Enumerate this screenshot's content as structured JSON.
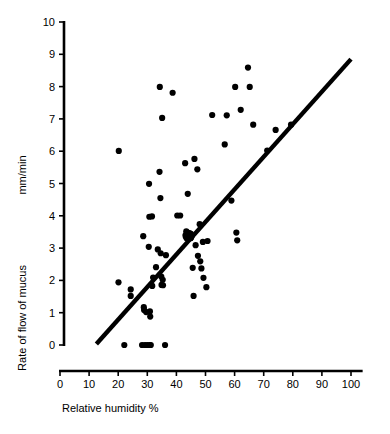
{
  "chart_data": {
    "type": "scatter",
    "title": "",
    "xlabel": "Relative humidity %",
    "ylabel_primary": "mm/min",
    "ylabel_secondary": "Rate of flow of mucus",
    "xlim": [
      0,
      104
    ],
    "ylim": [
      0,
      10
    ],
    "grid": false,
    "legend": null,
    "x_ticks": [
      0,
      10,
      20,
      30,
      40,
      50,
      60,
      70,
      80,
      90,
      100
    ],
    "x_tick_labels": [
      "0",
      "10",
      "20",
      "30",
      "40",
      "50",
      "60",
      "70",
      "80",
      "90",
      "100"
    ],
    "y_ticks": [
      0,
      1,
      2,
      3,
      4,
      5,
      6,
      7,
      8,
      9,
      10
    ],
    "y_tick_labels": [
      "0",
      "1",
      "2",
      "3",
      "4",
      "5",
      "6",
      "7",
      "8",
      "9",
      "10"
    ],
    "marker_color": "#000000",
    "marker_size": 3.1,
    "centroid": {
      "x": 44.2,
      "y": 3.38,
      "size": 6.2
    },
    "fit_line": {
      "color": "#000000",
      "width": 4.4,
      "x_start": 12.5,
      "y_start": 0.03,
      "x_end": 100.0,
      "y_end": 8.85
    },
    "points": [
      {
        "x": 20.2,
        "y": 6.01
      },
      {
        "x": 20.1,
        "y": 1.94
      },
      {
        "x": 22.1,
        "y": 0.0
      },
      {
        "x": 24.3,
        "y": 1.72
      },
      {
        "x": 24.3,
        "y": 1.52
      },
      {
        "x": 28.2,
        "y": 0.0
      },
      {
        "x": 28.6,
        "y": 3.37
      },
      {
        "x": 28.8,
        "y": 1.17
      },
      {
        "x": 28.9,
        "y": 1.08
      },
      {
        "x": 29.2,
        "y": 0.0
      },
      {
        "x": 29.6,
        "y": 1.02
      },
      {
        "x": 30.0,
        "y": 0.0
      },
      {
        "x": 30.5,
        "y": 3.04
      },
      {
        "x": 30.6,
        "y": 4.99
      },
      {
        "x": 30.7,
        "y": 3.97
      },
      {
        "x": 30.8,
        "y": 0.0
      },
      {
        "x": 30.9,
        "y": 1.04
      },
      {
        "x": 31.0,
        "y": 0.88
      },
      {
        "x": 31.2,
        "y": 0.0
      },
      {
        "x": 31.6,
        "y": 3.98
      },
      {
        "x": 31.7,
        "y": 1.83
      },
      {
        "x": 32.0,
        "y": 2.09
      },
      {
        "x": 33.0,
        "y": 2.41
      },
      {
        "x": 33.6,
        "y": 2.96
      },
      {
        "x": 34.2,
        "y": 5.36
      },
      {
        "x": 34.3,
        "y": 7.99
      },
      {
        "x": 34.5,
        "y": 4.55
      },
      {
        "x": 34.6,
        "y": 2.84
      },
      {
        "x": 34.8,
        "y": 2.12
      },
      {
        "x": 34.9,
        "y": 1.86
      },
      {
        "x": 35.1,
        "y": 7.03
      },
      {
        "x": 35.3,
        "y": 2.02
      },
      {
        "x": 35.4,
        "y": 1.85
      },
      {
        "x": 36.1,
        "y": 0.0
      },
      {
        "x": 36.4,
        "y": 2.78
      },
      {
        "x": 38.7,
        "y": 7.81
      },
      {
        "x": 40.3,
        "y": 4.01
      },
      {
        "x": 41.3,
        "y": 4.01
      },
      {
        "x": 43.0,
        "y": 5.63
      },
      {
        "x": 43.4,
        "y": 3.52
      },
      {
        "x": 43.9,
        "y": 4.68
      },
      {
        "x": 44.8,
        "y": 3.44
      },
      {
        "x": 45.0,
        "y": 3.32
      },
      {
        "x": 45.6,
        "y": 2.39
      },
      {
        "x": 45.9,
        "y": 1.52
      },
      {
        "x": 46.2,
        "y": 5.76
      },
      {
        "x": 46.6,
        "y": 3.09
      },
      {
        "x": 47.2,
        "y": 5.44
      },
      {
        "x": 47.4,
        "y": 2.76
      },
      {
        "x": 48.0,
        "y": 3.74
      },
      {
        "x": 48.2,
        "y": 2.59
      },
      {
        "x": 48.6,
        "y": 2.37
      },
      {
        "x": 49.1,
        "y": 3.19
      },
      {
        "x": 49.3,
        "y": 2.08
      },
      {
        "x": 50.3,
        "y": 1.79
      },
      {
        "x": 50.7,
        "y": 3.22
      },
      {
        "x": 52.3,
        "y": 7.12
      },
      {
        "x": 56.6,
        "y": 6.21
      },
      {
        "x": 57.3,
        "y": 7.11
      },
      {
        "x": 58.9,
        "y": 4.47
      },
      {
        "x": 60.2,
        "y": 7.99
      },
      {
        "x": 60.6,
        "y": 3.48
      },
      {
        "x": 60.9,
        "y": 3.24
      },
      {
        "x": 62.1,
        "y": 7.28
      },
      {
        "x": 64.6,
        "y": 8.59
      },
      {
        "x": 65.2,
        "y": 7.99
      },
      {
        "x": 66.4,
        "y": 6.82
      },
      {
        "x": 71.2,
        "y": 6.02
      },
      {
        "x": 74.1,
        "y": 6.66
      },
      {
        "x": 79.4,
        "y": 6.82
      }
    ]
  }
}
